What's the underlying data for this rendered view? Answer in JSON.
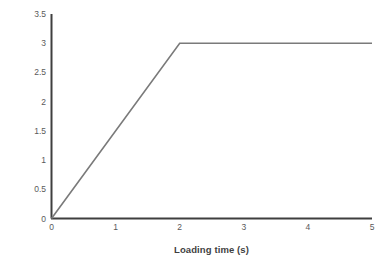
{
  "chart_data": {
    "type": "line",
    "title": "",
    "xlabel": "Loading time (s)",
    "ylabel": "Pressure (MPa)",
    "xlim": [
      0,
      5
    ],
    "ylim": [
      0,
      3.5
    ],
    "grid": false,
    "legend": false,
    "legend_position": "none",
    "x_ticks": [
      "0",
      "1",
      "2",
      "3",
      "4",
      "5"
    ],
    "x_tick_values": [
      0,
      1,
      2,
      3,
      4,
      5
    ],
    "y_ticks": [
      "0",
      "0.5",
      "1",
      "1.5",
      "2",
      "2.5",
      "3",
      "3.5"
    ],
    "y_tick_values": [
      0,
      0.5,
      1,
      1.5,
      2,
      2.5,
      3,
      3.5
    ],
    "series": [
      {
        "name": "Pressure",
        "color": "#7a7a7a",
        "x": [
          0,
          2,
          5
        ],
        "y": [
          0,
          3,
          3
        ],
        "points": [
          {
            "x": 0,
            "y": 0
          },
          {
            "x": 2,
            "y": 3
          },
          {
            "x": 5,
            "y": 3
          }
        ]
      }
    ],
    "annotations": []
  },
  "style": {
    "background": "#ffffff",
    "axis_color": "#3f3f3f",
    "tick_label_color": "#5a5a5a",
    "axis_title_color": "#3f3f3f",
    "line_color": "#7a7a7a"
  }
}
